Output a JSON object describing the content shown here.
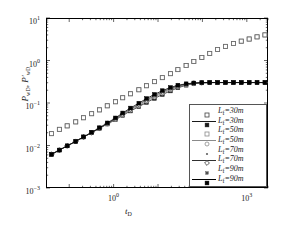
{
  "chart_data": {
    "type": "scatter",
    "title": "",
    "xlabel": "t_D",
    "ylabel": "P_wD, P'_wD",
    "xlabel_html": "t<sub>D</sub>",
    "ylabel_html": "P<sub>wD</sub>, P&prime;<sub>wD</sub>",
    "xscale": "log",
    "yscale": "log",
    "xlim": [
      0.03,
      3000
    ],
    "ylim": [
      0.001,
      10
    ],
    "grid": false,
    "legend_position": "lower-right",
    "xticks": [
      1,
      1000
    ],
    "xtick_labels": [
      "10^0",
      "10^3"
    ],
    "yticks": [
      0.001,
      0.01,
      0.1,
      1,
      10
    ],
    "ytick_labels": [
      "10^-3",
      "10^-2",
      "10^-1",
      "10^0",
      "10^1"
    ],
    "legend": [
      {
        "label": "L_f=30m",
        "style": "marker",
        "marker": "square-open",
        "color": "#404040"
      },
      {
        "label": "L_f=30m",
        "style": "line-marker",
        "marker": "square-filled",
        "color": "#1a1a1a"
      },
      {
        "label": "L_f=50m",
        "style": "marker",
        "marker": "square-open",
        "color": "#8a8a8a"
      },
      {
        "label": "L_f=50m",
        "style": "line-marker",
        "marker": "circle-open",
        "color": "#8a8a8a"
      },
      {
        "label": "L_f=70m",
        "style": "marker",
        "marker": "dot",
        "color": "#606060"
      },
      {
        "label": "L_f=70m",
        "style": "line-marker",
        "marker": "diamond",
        "color": "#303030"
      },
      {
        "label": "L_f=90m",
        "style": "marker",
        "marker": "square-small",
        "color": "#505050"
      },
      {
        "label": "L_f=90m",
        "style": "line-marker",
        "marker": "square-filled",
        "color": "#000000"
      }
    ],
    "series": [
      {
        "name": "P_wD L_f=30m",
        "kind": "pressure",
        "marker": "square-open",
        "color": "#4a4a4a",
        "x": [
          0.04,
          0.06,
          0.09,
          0.14,
          0.21,
          0.32,
          0.48,
          0.72,
          1.1,
          1.6,
          2.4,
          3.7,
          5.5,
          8.3,
          12.5,
          19,
          28,
          43,
          64,
          97,
          146,
          220,
          330,
          500,
          750,
          1130,
          1700,
          2560
        ],
        "y": [
          0.019,
          0.024,
          0.029,
          0.036,
          0.045,
          0.056,
          0.069,
          0.086,
          0.107,
          0.133,
          0.165,
          0.205,
          0.255,
          0.318,
          0.395,
          0.49,
          0.61,
          0.76,
          0.95,
          1.18,
          1.47,
          1.82,
          2.15,
          2.5,
          2.85,
          3.2,
          3.6,
          4.0
        ]
      },
      {
        "name": "P_wD L_f=50m",
        "kind": "pressure",
        "marker": "square-open",
        "color": "#6a6a6a",
        "x": [
          0.04,
          0.06,
          0.09,
          0.14,
          0.21,
          0.32,
          0.48,
          0.72,
          1.1,
          1.6,
          2.4,
          3.7,
          5.5,
          8.3,
          12.5,
          19,
          28,
          43,
          64,
          97,
          146,
          220,
          330,
          500,
          750,
          1130,
          1700,
          2560
        ],
        "y": [
          0.019,
          0.024,
          0.029,
          0.036,
          0.045,
          0.056,
          0.069,
          0.086,
          0.107,
          0.133,
          0.165,
          0.205,
          0.255,
          0.318,
          0.395,
          0.49,
          0.61,
          0.76,
          0.95,
          1.18,
          1.47,
          1.82,
          2.15,
          2.5,
          2.85,
          3.2,
          3.6,
          4.0
        ]
      },
      {
        "name": "P'_wD L_f=30m",
        "kind": "derivative",
        "marker": "square-filled",
        "color": "#1f1f1f",
        "x": [
          0.04,
          0.06,
          0.09,
          0.14,
          0.21,
          0.32,
          0.48,
          0.72,
          1.1,
          1.6,
          2.4,
          3.7,
          5.5,
          8.3,
          12.5,
          19,
          28,
          43,
          64,
          97,
          146,
          220,
          330,
          500,
          750,
          1130,
          1700,
          2560
        ],
        "y": [
          0.0062,
          0.0078,
          0.0098,
          0.0125,
          0.0158,
          0.02,
          0.0253,
          0.032,
          0.0405,
          0.0512,
          0.0648,
          0.082,
          0.103,
          0.128,
          0.158,
          0.192,
          0.228,
          0.262,
          0.285,
          0.297,
          0.302,
          0.303,
          0.303,
          0.303,
          0.303,
          0.303,
          0.303,
          0.303
        ]
      },
      {
        "name": "P'_wD L_f=50m",
        "kind": "derivative",
        "marker": "circle-open",
        "color": "#7a7a7a",
        "x": [
          0.04,
          0.06,
          0.09,
          0.14,
          0.21,
          0.32,
          0.48,
          0.72,
          1.1,
          1.6,
          2.4,
          3.7,
          5.5,
          8.3,
          12.5,
          19,
          28,
          43,
          64,
          97,
          146,
          220,
          330,
          500,
          750,
          1130,
          1700,
          2560
        ],
        "y": [
          0.0062,
          0.0078,
          0.0098,
          0.0125,
          0.0158,
          0.02,
          0.0253,
          0.032,
          0.041,
          0.0525,
          0.0672,
          0.086,
          0.11,
          0.138,
          0.17,
          0.205,
          0.24,
          0.268,
          0.289,
          0.299,
          0.303,
          0.303,
          0.303,
          0.303,
          0.303,
          0.303,
          0.303,
          0.303
        ]
      },
      {
        "name": "P'_wD L_f=70m",
        "kind": "derivative",
        "marker": "diamond",
        "color": "#3a3a3a",
        "x": [
          0.04,
          0.06,
          0.09,
          0.14,
          0.21,
          0.32,
          0.48,
          0.72,
          1.1,
          1.6,
          2.4,
          3.7,
          5.5,
          8.3,
          12.5,
          19,
          28,
          43,
          64,
          97,
          146,
          220,
          330,
          500,
          750,
          1130,
          1700,
          2560
        ],
        "y": [
          0.0062,
          0.0078,
          0.0098,
          0.0125,
          0.0158,
          0.02,
          0.0255,
          0.0328,
          0.0425,
          0.0552,
          0.0715,
          0.0925,
          0.118,
          0.148,
          0.182,
          0.218,
          0.251,
          0.276,
          0.293,
          0.301,
          0.303,
          0.303,
          0.303,
          0.303,
          0.303,
          0.303,
          0.303,
          0.303
        ]
      },
      {
        "name": "P'_wD L_f=90m",
        "kind": "derivative",
        "marker": "square-filled",
        "color": "#000000",
        "x": [
          0.04,
          0.06,
          0.09,
          0.14,
          0.21,
          0.32,
          0.48,
          0.72,
          1.1,
          1.6,
          2.4,
          3.7,
          5.5,
          8.3,
          12.5,
          19,
          28,
          43,
          64,
          97,
          146,
          220,
          330,
          500,
          750,
          1130,
          1700,
          2560
        ],
        "y": [
          0.0062,
          0.0078,
          0.0098,
          0.0125,
          0.016,
          0.0205,
          0.0262,
          0.034,
          0.0445,
          0.0582,
          0.076,
          0.099,
          0.127,
          0.159,
          0.195,
          0.231,
          0.262,
          0.283,
          0.296,
          0.302,
          0.303,
          0.303,
          0.303,
          0.303,
          0.303,
          0.303,
          0.303,
          0.303
        ]
      }
    ]
  }
}
